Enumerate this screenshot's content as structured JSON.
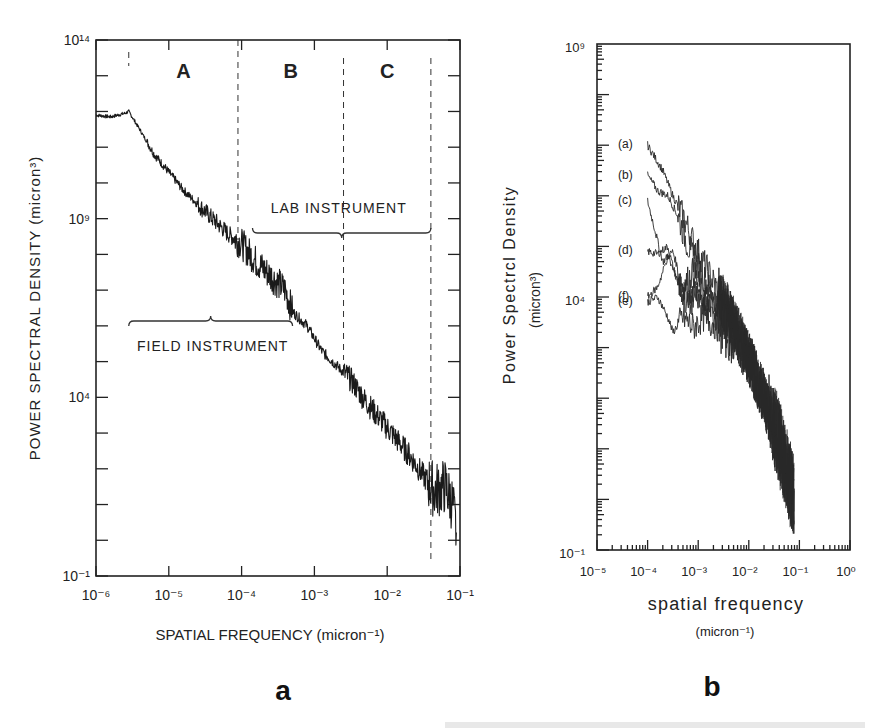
{
  "figure": {
    "panel_a_letter": "a",
    "panel_b_letter": "b",
    "caption_fragment": "(a) Spectra of ... (cut off)"
  },
  "chart_data": [
    {
      "panel": "a",
      "type": "line",
      "xlabel": "SPATIAL FREQUENCY  (micron⁻¹)",
      "ylabel": "POWER SPECTRAL DENSITY  (micron³)",
      "xscale": "log",
      "yscale": "log",
      "xlim": [
        1e-06,
        0.1
      ],
      "ylim": [
        0.1,
        100000000000000.0
      ],
      "x_tick_labels": [
        "10⁻⁶",
        "10⁻⁵",
        "10⁻⁴",
        "10⁻³",
        "10⁻²",
        "10⁻¹"
      ],
      "y_tick_labels": [
        "10¹⁴",
        "10⁹",
        "10⁴",
        "10⁻¹"
      ],
      "region_labels": [
        "A",
        "B",
        "C"
      ],
      "region_boundaries_log10_x": [
        -5.55,
        -4.05,
        -2.6,
        -1.4
      ],
      "annotations": [
        "LAB INSTRUMENT",
        "FIELD INSTRUMENT"
      ],
      "lab_instrument_range_log10_x": [
        -3.85,
        -1.4
      ],
      "field_instrument_range_log10_x": [
        -5.55,
        -3.3
      ],
      "grid": false,
      "series": [
        {
          "name": "composite spectrum",
          "log10_x": [
            -6.0,
            -5.8,
            -5.6,
            -5.55,
            -5.4,
            -5.2,
            -5.0,
            -4.8,
            -4.6,
            -4.4,
            -4.2,
            -4.0,
            -3.8,
            -3.6,
            -3.4,
            -3.3,
            -3.1,
            -2.9,
            -2.7,
            -2.5,
            -2.3,
            -2.1,
            -1.9,
            -1.7,
            -1.5,
            -1.35,
            -1.2,
            -1.1,
            -1.05
          ],
          "log10_y": [
            11.9,
            11.85,
            11.95,
            12.0,
            11.5,
            10.8,
            10.3,
            9.8,
            9.4,
            9.0,
            8.6,
            8.3,
            7.8,
            7.4,
            7.0,
            6.4,
            6.0,
            5.3,
            4.9,
            4.5,
            3.9,
            3.4,
            2.9,
            2.4,
            1.8,
            1.4,
            1.5,
            1.0,
            0.2
          ]
        }
      ]
    },
    {
      "panel": "b",
      "type": "line",
      "xlabel": "spatial frequency",
      "xlabel_units": "(micron⁻¹)",
      "ylabel": "Power Spectrcl Density",
      "ylabel_units": "(micron³)",
      "xscale": "log",
      "yscale": "log",
      "xlim": [
        1e-05,
        1.0
      ],
      "ylim": [
        0.1,
        1000000000.0
      ],
      "x_tick_labels": [
        "10⁻⁵",
        "10⁻⁴",
        "10⁻³",
        "10⁻²",
        "10⁻¹",
        "10⁰"
      ],
      "y_tick_labels": [
        "10⁹",
        "10⁴",
        "10⁻¹"
      ],
      "legend": [
        "(a)",
        "(b)",
        "(c)",
        "(d)",
        "(e)",
        "(f)"
      ],
      "grid": false,
      "series": [
        {
          "name": "(a)",
          "log10_x": [
            -4.0,
            -3.7,
            -3.5,
            -3.3,
            -3.1,
            -2.9,
            -2.6,
            -2.3,
            -2.0,
            -1.7,
            -1.4,
            -1.15,
            -1.1
          ],
          "log10_y": [
            7.0,
            6.5,
            6.0,
            5.6,
            5.1,
            4.7,
            4.1,
            3.5,
            2.8,
            2.0,
            1.1,
            0.2,
            -0.1
          ]
        },
        {
          "name": "(b)",
          "log10_x": [
            -4.0,
            -3.8,
            -3.6,
            -3.4,
            -3.2,
            -3.0,
            -2.7,
            -2.3,
            -2.0,
            -1.7,
            -1.4,
            -1.15,
            -1.1
          ],
          "log10_y": [
            6.4,
            6.1,
            6.0,
            5.6,
            5.0,
            4.6,
            4.0,
            3.5,
            2.8,
            2.0,
            1.1,
            0.2,
            -0.1
          ]
        },
        {
          "name": "(c)",
          "log10_x": [
            -4.0,
            -3.8,
            -3.7,
            -3.5,
            -3.3,
            -3.1,
            -2.9,
            -2.6,
            -2.3,
            -2.0,
            -1.7,
            -1.4,
            -1.15,
            -1.1
          ],
          "log10_y": [
            5.9,
            5.1,
            4.7,
            4.9,
            4.2,
            4.5,
            4.0,
            3.9,
            3.4,
            2.8,
            2.0,
            1.1,
            0.2,
            -0.1
          ]
        },
        {
          "name": "(d)",
          "log10_x": [
            -4.0,
            -3.8,
            -3.6,
            -3.5,
            -3.3,
            -3.1,
            -2.9,
            -2.6,
            -2.3,
            -2.0,
            -1.7,
            -1.4,
            -1.15,
            -1.1
          ],
          "log10_y": [
            4.9,
            4.85,
            5.0,
            4.6,
            4.0,
            4.2,
            3.9,
            3.8,
            3.4,
            2.8,
            2.0,
            1.1,
            0.2,
            -0.1
          ]
        },
        {
          "name": "(e)",
          "log10_x": [
            -4.0,
            -3.8,
            -3.6,
            -3.5,
            -3.3,
            -3.1,
            -2.9,
            -2.6,
            -2.3,
            -2.0,
            -1.7,
            -1.4,
            -1.15,
            -1.1
          ],
          "log10_y": [
            3.9,
            4.0,
            3.6,
            3.3,
            3.6,
            3.4,
            3.6,
            3.4,
            3.2,
            2.8,
            2.0,
            1.1,
            0.2,
            -0.1
          ]
        },
        {
          "name": "(f)",
          "log10_x": [
            -4.0,
            -3.8,
            -3.6,
            -3.4,
            -3.2,
            -3.0,
            -2.8,
            -2.6,
            -2.3,
            -2.0,
            -1.7,
            -1.4,
            -1.15,
            -1.1
          ],
          "log10_y": [
            4.0,
            4.2,
            4.8,
            4.3,
            3.8,
            4.1,
            3.7,
            3.6,
            3.2,
            2.8,
            2.0,
            1.1,
            0.2,
            -0.1
          ]
        }
      ]
    }
  ]
}
